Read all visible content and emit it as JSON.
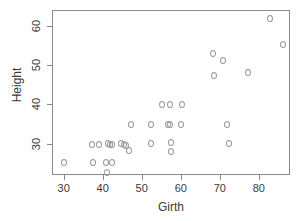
{
  "chart_data": {
    "type": "scatter",
    "title": "",
    "xlabel": "Girth",
    "ylabel": "Height",
    "xlim": [
      27,
      88
    ],
    "ylim": [
      22,
      64
    ],
    "xticks": [
      30,
      40,
      50,
      60,
      70,
      80
    ],
    "yticks": [
      30,
      40,
      50,
      60
    ],
    "grid": false,
    "legend": null,
    "marker": "open-circle",
    "marker_color": "#9a9a9a",
    "frame_color": "#8a8a8a",
    "x": [
      29.8,
      37.0,
      37.2,
      38.8,
      40.5,
      40.8,
      41.0,
      41.6,
      42.0,
      42.2,
      44.5,
      45.2,
      45.8,
      46.5,
      47.0,
      52.0,
      52.2,
      55.0,
      56.5,
      57.0,
      57.0,
      57.2,
      57.2,
      59.8,
      60.0,
      68.0,
      68.2,
      70.5,
      71.5,
      72.0,
      77.0,
      82.5,
      86.0
    ],
    "y": [
      25.5,
      30.0,
      25.5,
      30.0,
      25.5,
      23.0,
      30.2,
      30.0,
      25.5,
      30.0,
      30.2,
      30.0,
      29.8,
      28.5,
      35.2,
      35.2,
      30.2,
      40.3,
      35.2,
      40.3,
      35.2,
      30.5,
      28.3,
      35.2,
      40.3,
      53.2,
      47.5,
      51.3,
      35.2,
      30.4,
      48.4,
      62.2,
      55.5
    ],
    "points": [
      {
        "girth": 29.8,
        "height": 25.5
      },
      {
        "girth": 37.0,
        "height": 30.0
      },
      {
        "girth": 37.2,
        "height": 25.5
      },
      {
        "girth": 38.8,
        "height": 30.0
      },
      {
        "girth": 40.5,
        "height": 25.5
      },
      {
        "girth": 40.8,
        "height": 23.0
      },
      {
        "girth": 41.0,
        "height": 30.2
      },
      {
        "girth": 41.6,
        "height": 30.0
      },
      {
        "girth": 42.0,
        "height": 25.5
      },
      {
        "girth": 42.2,
        "height": 30.0
      },
      {
        "girth": 44.5,
        "height": 30.2
      },
      {
        "girth": 45.2,
        "height": 30.0
      },
      {
        "girth": 45.8,
        "height": 29.8
      },
      {
        "girth": 46.5,
        "height": 28.5
      },
      {
        "girth": 47.0,
        "height": 35.2
      },
      {
        "girth": 52.0,
        "height": 35.2
      },
      {
        "girth": 52.2,
        "height": 30.2
      },
      {
        "girth": 55.0,
        "height": 40.3
      },
      {
        "girth": 56.5,
        "height": 35.2
      },
      {
        "girth": 57.0,
        "height": 40.3
      },
      {
        "girth": 57.0,
        "height": 35.2
      },
      {
        "girth": 57.2,
        "height": 30.5
      },
      {
        "girth": 57.2,
        "height": 28.3
      },
      {
        "girth": 59.8,
        "height": 35.2
      },
      {
        "girth": 60.0,
        "height": 40.3
      },
      {
        "girth": 68.0,
        "height": 53.2
      },
      {
        "girth": 68.2,
        "height": 47.5
      },
      {
        "girth": 70.5,
        "height": 51.3
      },
      {
        "girth": 71.5,
        "height": 35.2
      },
      {
        "girth": 72.0,
        "height": 30.4
      },
      {
        "girth": 77.0,
        "height": 48.4
      },
      {
        "girth": 82.5,
        "height": 62.2
      },
      {
        "girth": 86.0,
        "height": 55.5
      }
    ]
  },
  "axis": {
    "x_tick_labels": [
      "30",
      "40",
      "50",
      "60",
      "70",
      "80"
    ],
    "y_tick_labels": [
      "30",
      "40",
      "50",
      "60"
    ],
    "x_title": "Girth",
    "y_title": "Height"
  }
}
